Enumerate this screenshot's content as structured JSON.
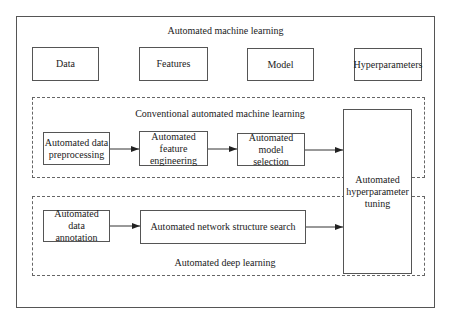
{
  "diagram": {
    "title": "Automated machine learning",
    "top_boxes": [
      "Data",
      "Features",
      "Model",
      "Hyperparameters"
    ],
    "conventional": {
      "label": "Conventional automated machine learning",
      "steps": [
        "Automated data preprocessing",
        "Automated feature engineering",
        "Automated model selection"
      ]
    },
    "deep": {
      "label": "Automated deep learning",
      "steps": [
        "Automated data annotation",
        "Automated network structure search"
      ]
    },
    "shared": "Automated hyperparameter tuning",
    "edges": [
      [
        "Automated data preprocessing",
        "Automated feature engineering"
      ],
      [
        "Automated feature engineering",
        "Automated model selection"
      ],
      [
        "Automated model selection",
        "Automated hyperparameter tuning"
      ],
      [
        "Automated data annotation",
        "Automated network structure search"
      ],
      [
        "Automated network structure search",
        "Automated hyperparameter tuning"
      ]
    ]
  }
}
